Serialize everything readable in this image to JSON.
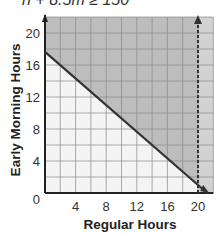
{
  "equation": "h + 8.5m ≥ 150",
  "chart_data": {
    "type": "line",
    "title": "h + 8.5m ≥ 150",
    "xlabel": "Regular Hours",
    "ylabel": "Early Morning Hours",
    "xlim": [
      0,
      22
    ],
    "ylim": [
      0,
      22
    ],
    "x_ticks": [
      4,
      8,
      12,
      16,
      20
    ],
    "y_ticks": [
      0,
      4,
      8,
      12,
      16,
      20
    ],
    "grid": true,
    "grid_step": 2,
    "series": [
      {
        "name": "boundary line h + 8.5m = 150",
        "style": "solid",
        "x": [
          0,
          21.2
        ],
        "y": [
          17.65,
          0
        ]
      },
      {
        "name": "x = 20",
        "style": "dashed",
        "x": [
          20,
          20
        ],
        "y": [
          0,
          22
        ],
        "arrow": "up"
      }
    ],
    "shaded_region": "above boundary line (solution set)",
    "annotations": []
  },
  "axes": {
    "x_label": "Regular Hours",
    "y_label": "Early Morning Hours",
    "x_ticks": [
      "4",
      "8",
      "12",
      "16",
      "20"
    ],
    "y_ticks": [
      "20",
      "16",
      "12",
      "8",
      "4",
      "0"
    ]
  },
  "colors": {
    "shade": "#bdbdbd",
    "shade_light": "#d2d2d2",
    "unshaded": "#f4f4f4",
    "grid": "#8a8a8a",
    "line": "#333333"
  }
}
